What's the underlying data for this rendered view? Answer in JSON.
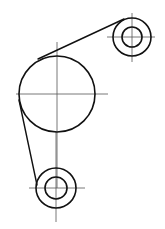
{
  "diagram": {
    "type": "belt-pulley-drawing",
    "colors": {
      "outline": "#111111",
      "centerline": "#555555",
      "background": "#ffffff"
    },
    "pulleys": [
      {
        "id": "large-pulley",
        "cx": 57,
        "cy": 94,
        "r_outer": 38,
        "r_inner": null,
        "centerline_h": [
          16,
          108
        ],
        "centerline_v": [
          42,
          188
        ]
      },
      {
        "id": "top-right-pulley",
        "cx": 132,
        "cy": 37,
        "r_outer": 19,
        "r_inner": 10,
        "centerline_h": [
          107,
          155
        ],
        "centerline_v": [
          13,
          62
        ]
      },
      {
        "id": "bottom-pulley",
        "cx": 56,
        "cy": 188,
        "r_outer": 20,
        "r_inner": 11,
        "centerline_h": [
          29,
          85
        ],
        "centerline_v": [
          132,
          222
        ]
      }
    ],
    "belts": [
      {
        "id": "belt-top",
        "x1": 38,
        "y1": 59,
        "x2": 124,
        "y2": 19
      },
      {
        "id": "belt-left",
        "x1": 19,
        "y1": 100,
        "x2": 37,
        "y2": 185
      }
    ]
  }
}
